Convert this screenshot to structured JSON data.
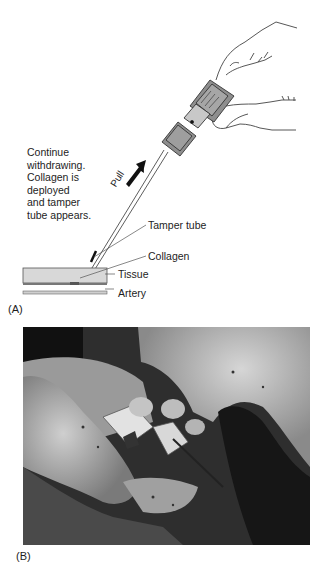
{
  "panel_a": {
    "label": "(A)",
    "instruction_lines": [
      "Continue",
      "withdrawing.",
      "Collagen is",
      "deployed",
      "and tamper",
      "tube appears."
    ],
    "direction_label": "Pull",
    "callouts": {
      "tamper_tube": "Tamper tube",
      "collagen": "Collagen",
      "tissue": "Tissue",
      "artery": "Artery"
    },
    "colors": {
      "tissue_fill": "#d8d8d8",
      "device_fill": "#8e8e8e",
      "line": "#333333"
    }
  },
  "panel_b": {
    "label": "(B)",
    "description": "Grayscale photograph of gloved hands holding a vascular closure device over a surgical site"
  }
}
